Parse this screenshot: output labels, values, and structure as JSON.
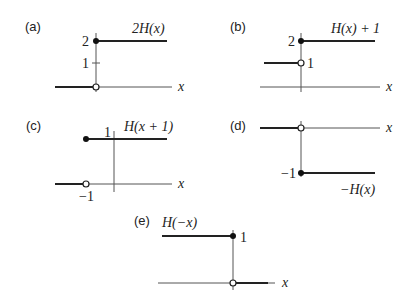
{
  "panels": [
    {
      "id": "a",
      "label": "(a)",
      "function_label": "2H(x)",
      "x_axis_label": "x",
      "y_ticks": [
        "2",
        "1"
      ],
      "closed_point": {
        "x": 0,
        "y": 2
      },
      "open_point": {
        "x": 0,
        "y": 0
      }
    },
    {
      "id": "b",
      "label": "(b)",
      "function_label": "H(x) + 1",
      "x_axis_label": "x",
      "y_ticks": [
        "2",
        "1"
      ],
      "closed_point": {
        "x": 0,
        "y": 2
      },
      "open_point": {
        "x": 0,
        "y": 1
      }
    },
    {
      "id": "c",
      "label": "(c)",
      "function_label": "H(x + 1)",
      "x_axis_label": "x",
      "y_ticks": [
        "1"
      ],
      "x_ticks": [
        "−1"
      ],
      "closed_point": {
        "x": -1,
        "y": 1
      },
      "open_point": {
        "x": -1,
        "y": 0
      }
    },
    {
      "id": "d",
      "label": "(d)",
      "function_label": "−H(x)",
      "x_axis_label": "x",
      "y_ticks": [
        "−1"
      ],
      "closed_point": {
        "x": 0,
        "y": -1
      },
      "open_point": {
        "x": 0,
        "y": 0
      }
    },
    {
      "id": "e",
      "label": "(e)",
      "function_label": "H(−x)",
      "x_axis_label": "x",
      "y_ticks": [
        "1"
      ],
      "closed_point": {
        "x": 0,
        "y": 1
      },
      "open_point": {
        "x": 0,
        "y": 0
      }
    }
  ]
}
